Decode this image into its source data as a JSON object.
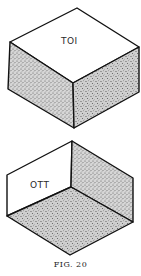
{
  "figures": [
    {
      "name": "closed-box",
      "label": "TOI",
      "description": "Isometric solid box with blank top face and stippled front faces"
    },
    {
      "name": "open-box-interior",
      "label": "OTT",
      "description": "Isometric open box interior view with blank left wall and stippled right wall and floor"
    }
  ],
  "caption": "FIG. 20",
  "colors": {
    "stroke": "#111111",
    "stipple": "#9a9a9a",
    "background": "#ffffff"
  }
}
